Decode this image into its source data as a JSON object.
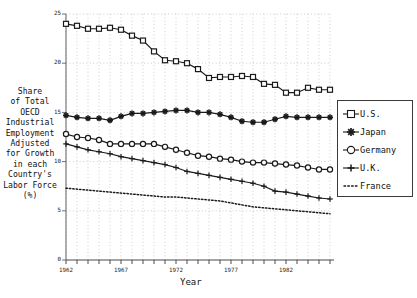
{
  "chart_data": {
    "type": "line",
    "title": "",
    "xlabel": "Year",
    "ylabel": "Share of Total OECD Industrial Employment Adjusted for Growth in each Country's Labor Force (%)",
    "xlim": [
      1962,
      1986
    ],
    "ylim": [
      0,
      25
    ],
    "yticks": [
      0,
      5,
      10,
      15,
      20,
      25
    ],
    "xticks": [
      1962,
      1967,
      1972,
      1977,
      1982
    ],
    "grid": true,
    "grid_style": "dotted",
    "legend_position": "right",
    "x": [
      1962,
      1963,
      1964,
      1965,
      1966,
      1967,
      1968,
      1969,
      1970,
      1971,
      1972,
      1973,
      1974,
      1975,
      1976,
      1977,
      1978,
      1979,
      1980,
      1981,
      1982,
      1983,
      1984,
      1985,
      1986
    ],
    "series": [
      {
        "name": "U.S.",
        "marker": "square",
        "line": "solid",
        "values": [
          24.0,
          23.8,
          23.5,
          23.5,
          23.6,
          23.4,
          22.8,
          22.3,
          21.2,
          20.3,
          20.2,
          20.0,
          19.4,
          18.5,
          18.6,
          18.6,
          18.7,
          18.6,
          17.9,
          17.8,
          17.0,
          17.0,
          17.5,
          17.3,
          17.3
        ]
      },
      {
        "name": "Japan",
        "marker": "asterisk",
        "line": "solid",
        "values": [
          14.7,
          14.5,
          14.4,
          14.4,
          14.2,
          14.6,
          14.9,
          14.9,
          15.0,
          15.1,
          15.2,
          15.2,
          15.0,
          15.0,
          14.8,
          14.5,
          14.1,
          14.0,
          14.0,
          14.3,
          14.6,
          14.5,
          14.5,
          14.5,
          14.5
        ]
      },
      {
        "name": "Germany",
        "marker": "circle",
        "line": "solid",
        "values": [
          12.8,
          12.5,
          12.4,
          12.2,
          11.8,
          11.8,
          11.8,
          11.8,
          11.8,
          11.5,
          11.2,
          10.9,
          10.6,
          10.5,
          10.3,
          10.2,
          10.0,
          9.9,
          9.9,
          9.8,
          9.7,
          9.6,
          9.4,
          9.2,
          9.2
        ]
      },
      {
        "name": "U.K.",
        "marker": "plus",
        "line": "solid",
        "values": [
          11.8,
          11.5,
          11.2,
          11.0,
          10.8,
          10.5,
          10.3,
          10.1,
          9.9,
          9.7,
          9.4,
          9.0,
          8.8,
          8.6,
          8.4,
          8.2,
          8.0,
          7.8,
          7.5,
          7.0,
          6.9,
          6.7,
          6.5,
          6.3,
          6.2
        ]
      },
      {
        "name": "France",
        "marker": "none",
        "line": "dotted",
        "values": [
          7.3,
          7.2,
          7.1,
          7.0,
          6.9,
          6.8,
          6.7,
          6.6,
          6.5,
          6.4,
          6.4,
          6.3,
          6.2,
          6.1,
          6.0,
          5.8,
          5.6,
          5.4,
          5.3,
          5.2,
          5.1,
          5.0,
          4.9,
          4.8,
          4.7
        ]
      }
    ]
  },
  "axis": {
    "ylabel_lines": [
      "Share",
      "of Total",
      "OECD",
      "Industrial",
      "Employment",
      "Adjusted",
      "for Growth",
      "in each",
      "Country's",
      "Labor Force",
      "(%)"
    ],
    "xlabel": "Year",
    "ytick_labels": [
      "25",
      "20",
      "15",
      "10",
      "5",
      "0"
    ],
    "xtick_labels": [
      "1962",
      "1967",
      "1972",
      "1977",
      "1982"
    ]
  },
  "legend": {
    "items": [
      {
        "label": "U.S.",
        "marker": "square-marker"
      },
      {
        "label": "Japan",
        "marker": "asterisk-marker"
      },
      {
        "label": "Germany",
        "marker": "circle-marker"
      },
      {
        "label": "U.K.",
        "marker": "plus-marker"
      },
      {
        "label": "France",
        "marker": "dotted-line-marker"
      }
    ]
  },
  "colors": {
    "line": "#1a1a1a",
    "grid": "#b9b9b9",
    "axis": "#6f6f6f",
    "background": "#ffffff"
  }
}
